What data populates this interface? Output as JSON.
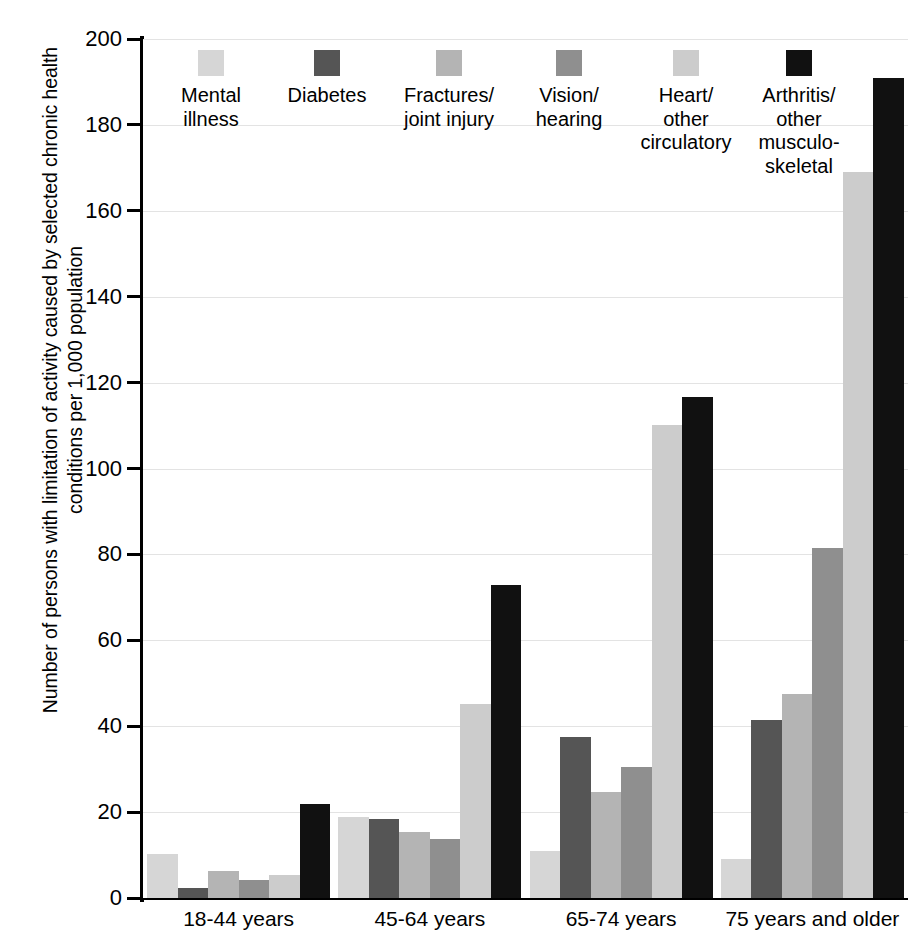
{
  "chart_data": {
    "type": "bar",
    "title": "",
    "subtitle": "",
    "xlabel": "",
    "ylabel": "Number of persons with limitation of activity caused by selected chronic health conditions per 1,000 population",
    "ylabel_lines": [
      "Number of persons with limitation of activity caused by selected chronic health",
      "conditions per 1,000 population"
    ],
    "categories": [
      "18-44 years",
      "45-64 years",
      "65-74 years",
      "75 years and older"
    ],
    "ylim": [
      0,
      200
    ],
    "yticks": [
      0,
      20,
      40,
      60,
      80,
      100,
      120,
      140,
      160,
      180,
      200
    ],
    "ytick_labels": [
      "0",
      "20",
      "40",
      "60",
      "80",
      "100",
      "120",
      "140",
      "160",
      "180",
      "200"
    ],
    "grid": true,
    "legend_position": "top-inside",
    "series": [
      {
        "name": "Mental illness",
        "label_lines": [
          "Mental",
          "illness"
        ],
        "color": "#d6d6d6",
        "values": [
          10.2,
          18.9,
          11.0,
          9.1
        ]
      },
      {
        "name": "Diabetes",
        "label_lines": [
          "Diabetes"
        ],
        "color": "#555555",
        "values": [
          2.4,
          18.5,
          37.6,
          41.4
        ]
      },
      {
        "name": "Fractures/joint injury",
        "label_lines": [
          "Fractures/",
          "joint injury"
        ],
        "color": "#b4b4b4",
        "values": [
          6.4,
          15.4,
          24.6,
          47.4
        ]
      },
      {
        "name": "Vision/hearing",
        "label_lines": [
          "Vision/",
          "hearing"
        ],
        "color": "#8f8f8f",
        "values": [
          4.2,
          13.7,
          30.4,
          81.5
        ]
      },
      {
        "name": "Heart/other circulatory",
        "label_lines": [
          "Heart/",
          "other",
          "circulatory"
        ],
        "color": "#cccccc",
        "values": [
          5.3,
          45.1,
          110.2,
          169.0
        ]
      },
      {
        "name": "Arthritis/other musculoskeletal",
        "label_lines": [
          "Arthritis/",
          "other",
          "musculo-",
          "skeletal"
        ],
        "color": "#111111",
        "values": [
          22.0,
          72.8,
          116.6,
          191.0
        ]
      }
    ]
  },
  "legend": {
    "items": [
      {
        "label": "Mental\nillness",
        "color": "#d6d6d6"
      },
      {
        "label": "Diabetes",
        "color": "#555555"
      },
      {
        "label": "Fractures/\njoint injury",
        "color": "#b4b4b4"
      },
      {
        "label": "Vision/\nhearing",
        "color": "#8f8f8f"
      },
      {
        "label": "Heart/\nother\ncirculatory",
        "color": "#cccccc"
      },
      {
        "label": "Arthritis/\nother\nmusculo-\nskeletal",
        "color": "#111111"
      }
    ]
  },
  "colors": {
    "axis": "#000000",
    "gridline": "#e3e3e3",
    "background": "#ffffff"
  }
}
